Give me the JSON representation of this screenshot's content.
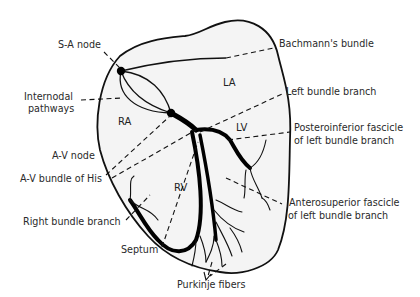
{
  "figure": {
    "type": "heart-conduction-system-diagram",
    "regions": {
      "ra": "RA",
      "la": "LA",
      "lv": "LV",
      "rv": "RV"
    },
    "labels_left": {
      "sa_node": "S-A node",
      "internodal_1": "Internodal",
      "internodal_2": "pathways",
      "av_node": "A-V node",
      "bundle_his": "A-V bundle of His",
      "right_bundle": "Right bundle branch",
      "septum": "Septum"
    },
    "labels_right": {
      "bachmann": "Bachmann's bundle",
      "left_bundle": "Left bundle branch",
      "posteroinferior_1": "Posteroinferior fascicle",
      "posteroinferior_2": "of left bundle branch",
      "anterosuperior_1": "Anterosuperior fascicle",
      "anterosuperior_2": "of left bundle branch"
    },
    "labels_bottom": {
      "purkinje": "Purkinje fibers"
    },
    "colors": {
      "background": "#ffffff",
      "heart_fill": "#f4f4f4",
      "stroke": "#111111",
      "text": "#2a2a2a"
    }
  }
}
